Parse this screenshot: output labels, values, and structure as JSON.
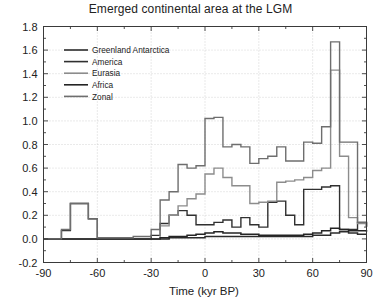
{
  "chart_data": {
    "type": "line",
    "title": "Emerged continental area at the LGM",
    "xlabel": "Time (kyr BP)",
    "ylabel": "",
    "xlim": [
      -90,
      90
    ],
    "ylim": [
      -0.2,
      1.8
    ],
    "xticks": [
      -90,
      -60,
      -30,
      0,
      30,
      60,
      90
    ],
    "xtick_labels": [
      "-90",
      "-60",
      "-30",
      "0",
      "30",
      "60",
      "90"
    ],
    "yticks": [
      -0.2,
      0.0,
      0.2,
      0.4,
      0.6,
      0.8,
      1.0,
      1.2,
      1.4,
      1.6,
      1.8
    ],
    "ytick_labels": [
      "-0.2",
      "0.0",
      "0.2",
      "0.4",
      "0.6",
      "0.8",
      "1.0",
      "1.2",
      "1.4",
      "1.6",
      "1.8"
    ],
    "grid": true,
    "minor_ticks": true,
    "drawstyle": "steps-post",
    "legend_position": "upper-left-inside",
    "x": [
      -90,
      -85,
      -80,
      -75,
      -70,
      -65,
      -60,
      -55,
      -50,
      -45,
      -40,
      -35,
      -30,
      -25,
      -20,
      -15,
      -10,
      -5,
      0,
      5,
      10,
      15,
      20,
      25,
      30,
      35,
      40,
      45,
      50,
      55,
      60,
      65,
      70,
      75,
      80,
      85,
      90
    ],
    "series": [
      {
        "name": "Greenland  Antarctica",
        "color": "#2b2b2b",
        "width": 1.5,
        "values": [
          0.0,
          0.0,
          0.0,
          0.0,
          0.0,
          0.0,
          0.0,
          0.0,
          0.0,
          0.0,
          0.0,
          0.0,
          0.0,
          0.0,
          0.01,
          0.01,
          0.01,
          0.01,
          0.02,
          0.02,
          0.02,
          0.02,
          0.02,
          0.02,
          0.02,
          0.02,
          0.02,
          0.02,
          0.02,
          0.02,
          0.03,
          0.03,
          0.05,
          0.06,
          0.05,
          0.04,
          0.04
        ]
      },
      {
        "name": "America",
        "color": "#303030",
        "width": 1.4,
        "values": [
          0.0,
          0.0,
          0.07,
          0.3,
          0.3,
          0.17,
          0.0,
          0.0,
          0.0,
          0.0,
          0.0,
          0.0,
          0.03,
          0.13,
          0.2,
          0.24,
          0.2,
          0.12,
          0.12,
          0.14,
          0.16,
          0.1,
          0.18,
          0.12,
          0.1,
          0.31,
          0.32,
          0.2,
          0.12,
          0.42,
          0.42,
          0.44,
          0.45,
          0.08,
          0.08,
          0.14,
          0.1
        ]
      },
      {
        "name": "Eurasia",
        "color": "#8c8c8c",
        "width": 1.4,
        "values": [
          0.0,
          0.0,
          0.0,
          0.0,
          0.0,
          0.0,
          0.0,
          0.0,
          0.0,
          0.0,
          0.0,
          0.0,
          0.0,
          0.11,
          0.2,
          0.28,
          0.34,
          0.38,
          0.55,
          0.6,
          0.52,
          0.45,
          0.45,
          0.3,
          0.31,
          0.32,
          0.48,
          0.49,
          0.5,
          0.52,
          0.58,
          0.6,
          1.43,
          0.7,
          0.18,
          0.13,
          0.1
        ]
      },
      {
        "name": "Africa",
        "color": "#242424",
        "width": 1.5,
        "values": [
          0.0,
          0.0,
          0.0,
          0.0,
          0.0,
          0.0,
          0.0,
          0.0,
          0.0,
          0.0,
          0.0,
          0.0,
          0.0,
          0.01,
          0.02,
          0.02,
          0.03,
          0.04,
          0.05,
          0.06,
          0.05,
          0.05,
          0.04,
          0.04,
          0.03,
          0.03,
          0.03,
          0.03,
          0.03,
          0.04,
          0.05,
          0.07,
          0.09,
          0.08,
          0.07,
          0.07,
          0.06
        ]
      },
      {
        "name": "Zonal",
        "color": "#6e6e6e",
        "width": 1.4,
        "values": [
          0.0,
          0.0,
          0.08,
          0.3,
          0.3,
          0.17,
          0.01,
          0.01,
          0.01,
          0.01,
          0.02,
          0.02,
          0.08,
          0.33,
          0.4,
          0.63,
          0.6,
          0.62,
          1.02,
          1.03,
          0.78,
          0.8,
          0.78,
          0.64,
          0.68,
          0.7,
          0.78,
          0.66,
          0.66,
          0.82,
          0.81,
          0.95,
          1.67,
          0.82,
          0.82,
          0.14,
          0.11
        ]
      }
    ],
    "legend_items": [
      {
        "label": "Greenland  Antarctica",
        "color": "#2b2b2b",
        "width": 1.7
      },
      {
        "label": "America",
        "color": "#303030",
        "width": 1.6
      },
      {
        "label": "Eurasia",
        "color": "#8c8c8c",
        "width": 1.6
      },
      {
        "label": "Africa",
        "color": "#242424",
        "width": 1.7
      },
      {
        "label": "Zonal",
        "color": "#6e6e6e",
        "width": 1.5
      }
    ]
  }
}
